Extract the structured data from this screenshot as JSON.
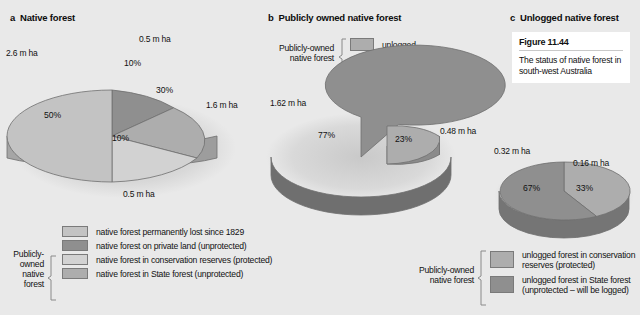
{
  "background_color": "#e9e9e9",
  "colors": {
    "lightest": "#d2d2d2",
    "light": "#c3c3c3",
    "medium": "#adadad",
    "dark": "#8f8f8f",
    "darker": "#7f7f7f",
    "edge": "#6e6e6e",
    "text": "#111111",
    "figure_box": "#ffffff"
  },
  "panels": {
    "a": {
      "letter": "a",
      "title": "Native forest",
      "labels": {
        "left": "2.6 m ha",
        "top": "0.5 m ha",
        "right": "1.6 m ha",
        "bottom": "0.5 m ha"
      }
    },
    "b": {
      "letter": "b",
      "title": "Publicly owned native forest",
      "labels": {
        "left": "1.62 m ha",
        "right": "0.48 m ha"
      },
      "legend_bracket_label": "Publicly-owned\nnative forest",
      "legend": [
        {
          "label": "unlogged",
          "color": "#adadad"
        },
        {
          "label": "logged",
          "color": "#8f8f8f"
        }
      ]
    },
    "c": {
      "letter": "c",
      "title": "Unlogged native forest",
      "labels": {
        "left": "0.32 m ha",
        "right": "0.16 m ha"
      }
    }
  },
  "figure_note": {
    "number": "Figure 11.44",
    "caption": "The status of native forest in south-west Australia"
  },
  "legend_main": {
    "bracket_label_lines": [
      "Publicly-",
      "owned",
      "native",
      "forest"
    ],
    "items": [
      {
        "label": "native forest permanently lost since 1829",
        "color": "#c3c3c3"
      },
      {
        "label": "native forest on private land (unprotected)",
        "color": "#8f8f8f"
      },
      {
        "label": "native forest in conservation reserves (protected)",
        "color": "#d2d2d2"
      },
      {
        "label": "native forest in State forest (unprotected)",
        "color": "#adadad"
      }
    ]
  },
  "legend_c": {
    "bracket_label_lines": [
      "Publicly-owned",
      "native forest"
    ],
    "items": [
      {
        "label": "unlogged forest in conservation\nreserves (protected)",
        "color": "#adadad"
      },
      {
        "label": "unlogged  forest in State forest\n(unprotected – will be logged)",
        "color": "#8f8f8f"
      }
    ]
  },
  "chart_data": [
    {
      "type": "pie",
      "id": "panel-a",
      "title": "Native forest",
      "unit": "m ha",
      "exploded": false,
      "three_d": true,
      "categories": [
        "native forest permanently lost since 1829",
        "native forest on private land (unprotected)",
        "native forest in State forest (unprotected)",
        "native forest in conservation reserves (protected)"
      ],
      "values": [
        50,
        10,
        30,
        10
      ],
      "value_labels": [
        "50%",
        "10%",
        "30%",
        "10%"
      ],
      "absolute_values": [
        2.6,
        0.5,
        1.6,
        0.5
      ],
      "absolute_labels": [
        "2.6 m ha",
        "0.5 m ha",
        "1.6 m ha",
        "0.5 m ha"
      ],
      "colors": [
        "#c3c3c3",
        "#8f8f8f",
        "#adadad",
        "#d2d2d2"
      ],
      "legend_position": "bottom-left"
    },
    {
      "type": "pie",
      "id": "panel-b",
      "title": "Publicly owned native forest",
      "unit": "m ha",
      "exploded": true,
      "three_d": true,
      "categories": [
        "logged",
        "unlogged"
      ],
      "values": [
        77,
        23
      ],
      "value_labels": [
        "77%",
        "23%"
      ],
      "absolute_values": [
        1.62,
        0.48
      ],
      "absolute_labels": [
        "1.62 m ha",
        "0.48 m ha"
      ],
      "colors": [
        "#8f8f8f",
        "#adadad"
      ],
      "legend_position": "top"
    },
    {
      "type": "pie",
      "id": "panel-c",
      "title": "Unlogged native forest",
      "unit": "m ha",
      "exploded": false,
      "three_d": true,
      "categories": [
        "unlogged forest in State forest (unprotected – will be logged)",
        "unlogged forest in conservation reserves (protected)"
      ],
      "values": [
        67,
        33
      ],
      "value_labels": [
        "67%",
        "33%"
      ],
      "absolute_values": [
        0.32,
        0.16
      ],
      "absolute_labels": [
        "0.32 m ha",
        "0.16 m ha"
      ],
      "colors": [
        "#8f8f8f",
        "#adadad"
      ],
      "legend_position": "bottom"
    }
  ]
}
